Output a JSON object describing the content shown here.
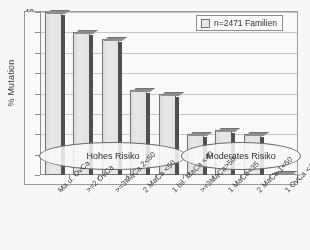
{
  "chart_data": {
    "type": "bar",
    "title": "",
    "subtitle": "",
    "xlabel": "",
    "ylabel": "% Mutation",
    "ylim": [
      0,
      40
    ],
    "yticks": [
      0,
      5,
      10,
      15,
      20,
      25,
      30,
      35,
      40
    ],
    "ytick_labels": [
      "0",
      "5",
      "10",
      "15",
      "20",
      "25",
      "30",
      "35",
      "40"
    ],
    "grid": true,
    "legend_position": "top-right",
    "legend": [
      "n=2471 Familien"
    ],
    "categories": [
      "Ma u. OvCa",
      ">=2 OvCa",
      ">=3MaCa 2<50",
      "2 MaCa <50",
      "1 bil. MaCa <40",
      ">=3MaCa>50",
      "1 MaCa<35",
      "2 MaCa 1<50",
      "1 OvCa <40"
    ],
    "values": [
      40.0,
      35.0,
      33.5,
      20.8,
      20.0,
      10.0,
      11.0,
      10.0,
      0.3
    ],
    "series": [
      {
        "name": "n=2471 Familien",
        "values": [
          40.0,
          35.0,
          33.5,
          20.8,
          20.0,
          10.0,
          11.0,
          10.0,
          0.3
        ]
      }
    ],
    "annotations": [
      {
        "text": "Hohes Risiko",
        "covers": [
          0,
          4
        ]
      },
      {
        "text": "Moderates Risiko",
        "covers": [
          5,
          8
        ]
      }
    ],
    "colors": {
      "bar_fill": "#eeeeec",
      "bar_edge": "#6f6f6f",
      "bar_shadow": "#4a4a4a",
      "grid": "#c9c9c9",
      "axis": "#8d8d8d",
      "text": "#2f2f2f"
    }
  },
  "legend": {
    "entry_label": "n=2471 Familien",
    "swatch_icon": "square-swatch-icon"
  },
  "axes": {
    "y_title": "% Mutation"
  },
  "annotations": {
    "high_risk": "Hohes Risiko",
    "moderate_risk": "Moderates Risiko"
  }
}
